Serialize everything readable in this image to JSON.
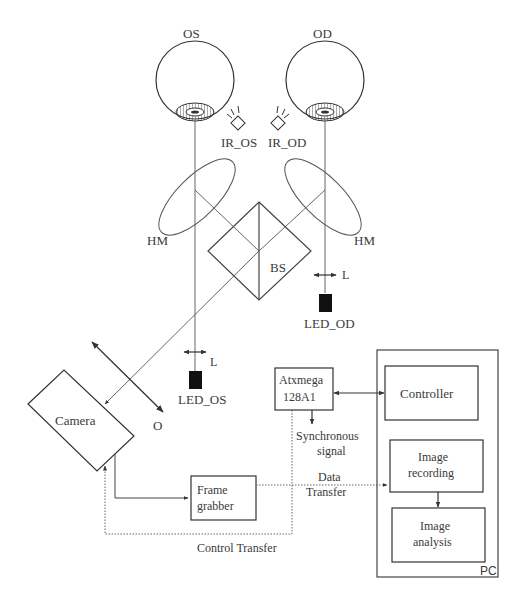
{
  "diagram": {
    "type": "eye-tracking optical and control setup",
    "eyes": {
      "left": {
        "label": "OS"
      },
      "right": {
        "label": "OD"
      }
    },
    "ir_sources": {
      "left": {
        "label": "IR_OS"
      },
      "right": {
        "label": "IR_OD"
      }
    },
    "mirrors": {
      "left": {
        "label": "HM"
      },
      "right": {
        "label": "HM"
      }
    },
    "beam_splitter": {
      "label": "BS"
    },
    "leds": {
      "left": {
        "label": "LED_OS",
        "lens_label": "L"
      },
      "right": {
        "label": "LED_OD",
        "lens_label": "L"
      }
    },
    "camera": {
      "label": "Camera"
    },
    "objective": {
      "label": "O"
    },
    "microcontroller": {
      "line1": "Atxmega",
      "line2": "128A1"
    },
    "frame_grabber": {
      "line1": "Frame",
      "line2": "grabber"
    },
    "pc": {
      "label": "PC",
      "controller": {
        "label": "Controller"
      },
      "image_recording": {
        "line1": "Image",
        "line2": "recording"
      },
      "image_analysis": {
        "line1": "Image",
        "line2": "analysis"
      }
    },
    "signals": {
      "synchronous": {
        "line1": "Synchronous",
        "line2": "signal"
      },
      "data_transfer": {
        "line1": "Data",
        "line2": "Transfer"
      },
      "control_transfer": {
        "label": "Control Transfer"
      }
    },
    "colors": {
      "line": "#444444",
      "dotted": "#666666",
      "led_fill": "#111111",
      "background": "#ffffff"
    }
  }
}
